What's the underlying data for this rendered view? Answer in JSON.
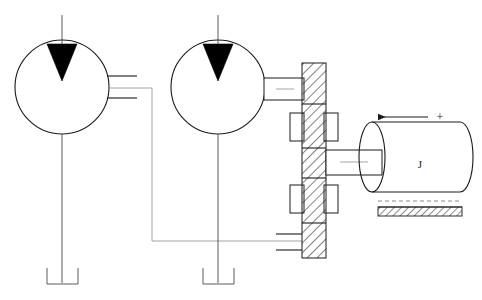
{
  "figure": {
    "title": "",
    "background_color": "#ffffff",
    "line_color": "#1a1a1a",
    "centerline_color": "#9a9a9a",
    "hatch_color": "#1a1a1a",
    "width": 482,
    "height": 300
  },
  "labels": {
    "inertia_label": "J",
    "polarity_plus": "+",
    "arrow_direction": "left"
  },
  "components": {
    "left_dial": {
      "name": "left-gauge-circle",
      "pointer": "filled-triangle-down",
      "cx": 62,
      "cy": 87,
      "r": 47
    },
    "right_dial": {
      "name": "right-gauge-circle",
      "pointer": "filled-triangle-down",
      "cx": 218,
      "cy": 87,
      "r": 47
    },
    "hatched_column": {
      "name": "hatched-wall-column",
      "x": 302,
      "y": 63,
      "width": 24,
      "height": 195,
      "segments": 5
    },
    "cylinder": {
      "name": "inertia-cylinder",
      "x": 372,
      "y": 122,
      "width": 88,
      "height": 70
    },
    "ground": {
      "name": "ground-hatch",
      "x": 378,
      "y": 205,
      "width": 84,
      "height": 10
    }
  }
}
